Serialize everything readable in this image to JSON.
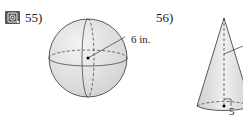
{
  "problems": [
    {
      "number": "55)",
      "shape": "sphere",
      "radius_label": "6 in.",
      "has_video_icon": true
    },
    {
      "number": "56)",
      "shape": "cone",
      "radius_label": "5 ft"
    }
  ],
  "icons": {
    "video": "video-play-icon"
  }
}
